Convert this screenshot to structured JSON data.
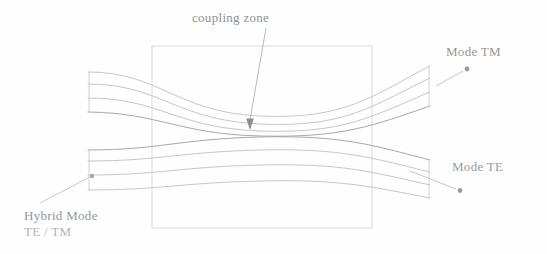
{
  "figure": {
    "title_label": "coupling zone",
    "labels": {
      "coupling_zone": "coupling zone",
      "mode_tm": "Mode TM",
      "mode_te": "Mode TE",
      "hybrid_mode_line1": "Hybrid Mode",
      "hybrid_mode_line2": "TE / TM"
    },
    "colors": {
      "background": "#fefefe",
      "line": "#b9b9b9",
      "line_dark": "#9e9e9e",
      "rectangle": "#d2d2d2",
      "arrow": "#aaaaaa",
      "text": "#9a9a9a"
    },
    "geometry": {
      "coupling_rect": {
        "x": 152,
        "y": 46,
        "width": 220,
        "height": 182
      },
      "upper_waveguide": {
        "left_x": 88,
        "right_x": 430,
        "top_y": 72,
        "bottom_y": 134,
        "curve_sag": 26
      },
      "lower_waveguide": {
        "left_x": 88,
        "right_x": 430,
        "top_y": 136,
        "bottom_y": 200,
        "curve_rise": 22
      },
      "curves_per_waveguide": 4
    },
    "annotations": [
      {
        "name": "coupling-zone-arrow",
        "from": [
          265,
          27
        ],
        "to": [
          250,
          128
        ]
      },
      {
        "name": "mode-tm-arrow",
        "from": [
          438,
          84
        ],
        "to": [
          468,
          68
        ]
      },
      {
        "name": "mode-te-arrow",
        "from": [
          412,
          172
        ],
        "to": [
          461,
          191
        ]
      },
      {
        "name": "hybrid-mode-arrow",
        "from": [
          42,
          201
        ],
        "to": [
          94,
          176
        ]
      }
    ]
  }
}
